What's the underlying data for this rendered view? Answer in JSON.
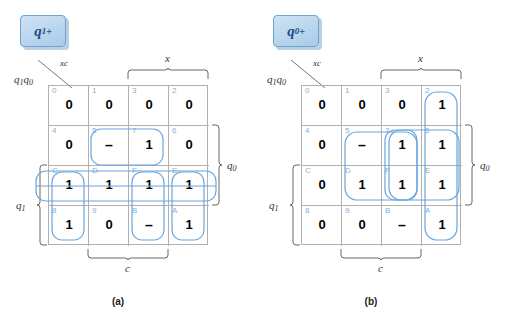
{
  "figure": {
    "caption_a": "(a)",
    "caption_b": "(b)"
  },
  "maps": [
    {
      "id": "map-a",
      "badge": {
        "base": "q",
        "sub": "1",
        "sup": "+"
      },
      "corner": {
        "top_label": "xc",
        "bottom_label_base": "q",
        "bottom_sub_1": "1",
        "bottom_base_2": "q",
        "bottom_sub_2": "0"
      },
      "axis_labels": {
        "top": "x",
        "right_base": "q",
        "right_sub": "0",
        "left_base": "q",
        "left_sub": "1",
        "bottom": "c"
      },
      "cell_indices": [
        [
          "0",
          "1",
          "3",
          "2"
        ],
        [
          "4",
          "5",
          "7",
          "6"
        ],
        [
          "C",
          "D",
          "F",
          "E"
        ],
        [
          "8",
          "9",
          "B",
          "A"
        ]
      ],
      "cell_values": [
        [
          "0",
          "0",
          "0",
          "0"
        ],
        [
          "0",
          "–",
          "1",
          "0"
        ],
        [
          "1",
          "1",
          "1",
          "1"
        ],
        [
          "1",
          "0",
          "–",
          "1"
        ]
      ]
    },
    {
      "id": "map-b",
      "badge": {
        "base": "q",
        "sub": "0",
        "sup": "+"
      },
      "corner": {
        "top_label": "xc",
        "bottom_label_base": "q",
        "bottom_sub_1": "1",
        "bottom_base_2": "q",
        "bottom_sub_2": "0"
      },
      "axis_labels": {
        "top": "x",
        "right_base": "q",
        "right_sub": "0",
        "left_base": "q",
        "left_sub": "1",
        "bottom": "c"
      },
      "cell_indices": [
        [
          "0",
          "1",
          "3",
          "2"
        ],
        [
          "4",
          "5",
          "7",
          "6"
        ],
        [
          "C",
          "D",
          "F",
          "E"
        ],
        [
          "8",
          "9",
          "B",
          "A"
        ]
      ],
      "cell_values": [
        [
          "0",
          "0",
          "0",
          "1"
        ],
        [
          "0",
          "–",
          "1",
          "1"
        ],
        [
          "0",
          "1",
          "1",
          "1"
        ],
        [
          "0",
          "0",
          "–",
          "1"
        ]
      ]
    }
  ],
  "colors": {
    "group_stroke": "#6aa6dc",
    "grid_line": "#b0b0b0",
    "index_text": "#7fb0da",
    "badge_text": "#1b4f82",
    "bracket": "#666666"
  }
}
